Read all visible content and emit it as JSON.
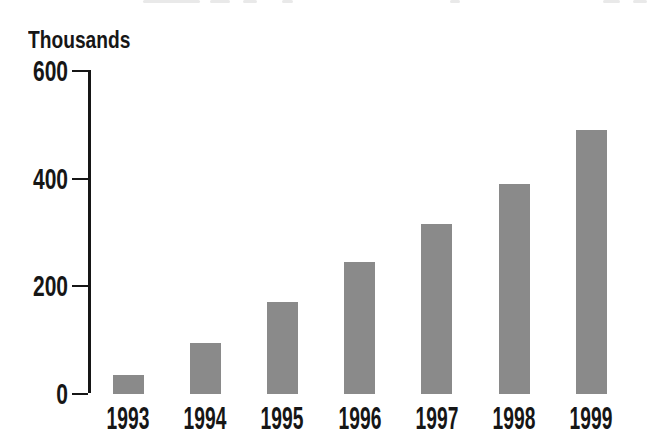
{
  "chart_data": {
    "type": "bar",
    "title": "",
    "unit_label": "Thousands",
    "categories": [
      "1993",
      "1994",
      "1995",
      "1996",
      "1997",
      "1998",
      "1999"
    ],
    "values": [
      35,
      95,
      170,
      245,
      315,
      390,
      490
    ],
    "xlabel": "",
    "ylabel": "Thousands",
    "ylim": [
      0,
      600
    ],
    "yticks": [
      0,
      200,
      400,
      600
    ],
    "grid": false,
    "legend": "none",
    "bar_color": "#8a8a8a",
    "ink_color": "#161616",
    "background": "#ffffff"
  }
}
